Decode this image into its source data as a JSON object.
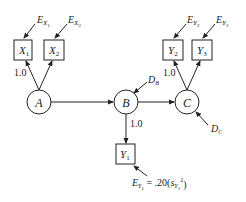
{
  "diagram": {
    "type": "path diagram (structural equation model)",
    "latent_variables": [
      {
        "id": "A",
        "label": "A"
      },
      {
        "id": "B",
        "label": "B"
      },
      {
        "id": "C",
        "label": "C"
      }
    ],
    "observed_variables": [
      {
        "id": "X1",
        "label": "X",
        "sub": "1",
        "error": {
          "label": "E",
          "sub": "X",
          "subsub": "1"
        }
      },
      {
        "id": "X2",
        "label": "X",
        "sub": "2",
        "error": {
          "label": "E",
          "sub": "X",
          "subsub": "2"
        }
      },
      {
        "id": "Y2",
        "label": "Y",
        "sub": "2",
        "error": {
          "label": "E",
          "sub": "Y",
          "subsub": "2"
        }
      },
      {
        "id": "Y3",
        "label": "Y",
        "sub": "3",
        "error": {
          "label": "E",
          "sub": "Y",
          "subsub": "3"
        }
      },
      {
        "id": "Y1",
        "label": "Y",
        "sub": "1",
        "error": {
          "label": "E",
          "sub": "Y",
          "subsub": "1",
          "equation": "= .20(s",
          "eq_sub": "Y",
          "eq_subsub": "1",
          "eq_sup": "2",
          "eq_close": ")"
        }
      }
    ],
    "disturbances": [
      {
        "id": "DB",
        "label": "D",
        "sub": "B"
      },
      {
        "id": "DC",
        "label": "D",
        "sub": "C"
      }
    ],
    "paths": [
      {
        "from": "A",
        "to": "X1",
        "label": "1.0"
      },
      {
        "from": "A",
        "to": "X2"
      },
      {
        "from": "A",
        "to": "B"
      },
      {
        "from": "B",
        "to": "C"
      },
      {
        "from": "B",
        "to": "Y1",
        "label": "1.0"
      },
      {
        "from": "C",
        "to": "Y2",
        "label": "1.0"
      },
      {
        "from": "C",
        "to": "Y3"
      }
    ],
    "fixed_loading_label": "1.0"
  }
}
